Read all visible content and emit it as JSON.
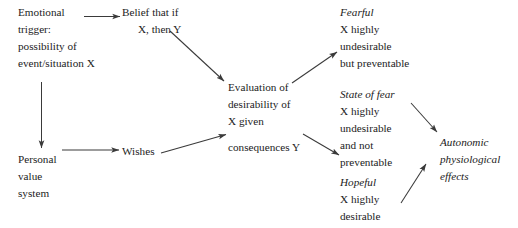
{
  "diagram": {
    "background_color": "#ffffff",
    "line_color": "#3a3a3a",
    "text_color": "#1c1c1c",
    "nodes": {
      "emotional_trigger": {
        "lines": [
          "Emotional",
          "trigger:",
          "possibility of",
          "event/situation X"
        ]
      },
      "belief": {
        "lines": [
          "Belief that if",
          "X, then Y"
        ]
      },
      "evaluation": {
        "lines": [
          "Evaluation of",
          "desirability of",
          "X given",
          "consequences Y"
        ]
      },
      "personal_value_system": {
        "lines": [
          "Personal",
          "value",
          "system"
        ]
      },
      "wishes": {
        "lines": [
          "Wishes"
        ]
      },
      "fearful": {
        "label": "Fearful",
        "lines": [
          "X highly",
          "undesirable",
          "but preventable"
        ]
      },
      "state_of_fear": {
        "label": "State of fear",
        "lines": [
          "X highly",
          "undesirable",
          "and not",
          "preventable"
        ]
      },
      "hopeful": {
        "label": "Hopeful",
        "lines": [
          "X highly",
          "desirable"
        ]
      },
      "autonomic": {
        "lines": [
          "Autonomic",
          "physiological",
          "effects"
        ]
      }
    },
    "edges": [
      {
        "name": "emotional-trigger-to-belief",
        "from": "emotional_trigger",
        "to": "belief"
      },
      {
        "name": "emotional-trigger-to-personal-value",
        "from": "emotional_trigger",
        "to": "personal_value_system"
      },
      {
        "name": "belief-to-evaluation",
        "from": "belief",
        "to": "evaluation"
      },
      {
        "name": "personal-value-to-wishes",
        "from": "personal_value_system",
        "to": "wishes"
      },
      {
        "name": "wishes-to-evaluation",
        "from": "wishes",
        "to": "evaluation"
      },
      {
        "name": "evaluation-to-fearful",
        "from": "evaluation",
        "to": "fearful"
      },
      {
        "name": "evaluation-to-state-of-fear",
        "from": "evaluation",
        "to": "state_of_fear"
      },
      {
        "name": "state-of-fear-to-autonomic",
        "from": "state_of_fear",
        "to": "autonomic"
      },
      {
        "name": "hopeful-to-autonomic",
        "from": "hopeful",
        "to": "autonomic"
      }
    ]
  }
}
